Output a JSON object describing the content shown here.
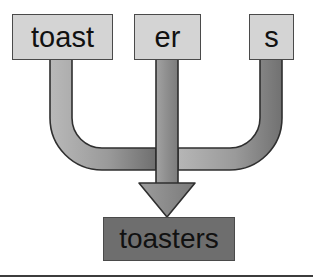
{
  "diagram": {
    "type": "morphological-merge",
    "title": "",
    "background_color": "#ffffff",
    "source_box_fill": "#d4d4d4",
    "source_box_border": "#4a4a4a",
    "result_box_fill": "#6e6e6e",
    "result_box_border": "#2e2e2e",
    "arrow_fill_light": "#b4b4b4",
    "arrow_fill_dark": "#6f6f6f",
    "arrow_stroke": "#2e2e2e",
    "rule_color": "#3c3c3c",
    "sources": [
      {
        "id": "toast",
        "label": "toast"
      },
      {
        "id": "er",
        "label": "er"
      },
      {
        "id": "s",
        "label": "s"
      }
    ],
    "result": {
      "id": "toasters",
      "label": "toasters"
    },
    "connector": {
      "name": "merge-arrow",
      "icon": "down-arrow-icon",
      "branches": 3,
      "arrowhead": "down"
    }
  }
}
